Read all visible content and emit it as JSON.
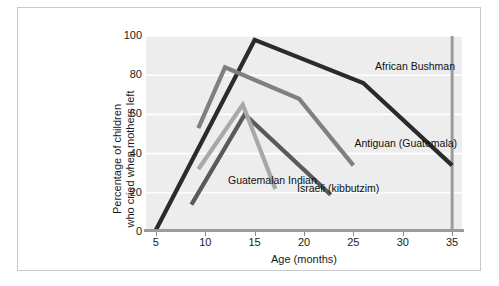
{
  "chart_data": {
    "type": "line",
    "title": "",
    "subtitle": "",
    "xlabel": "Age (months)",
    "ylabel": "Percentage of children who cried when mothers left",
    "ylabel_line1": "Percentage of children",
    "ylabel_line2": "who cried when mothers left",
    "xlim": [
      4,
      36
    ],
    "ylim": [
      0,
      100
    ],
    "xticks": [
      5,
      10,
      15,
      20,
      25,
      30,
      35
    ],
    "yticks": [
      0,
      20,
      40,
      60,
      80,
      100
    ],
    "xtick_labels": [
      "5",
      "10",
      "15",
      "20",
      "25",
      "30",
      "35"
    ],
    "ytick_labels": [
      "0",
      "20",
      "40",
      "60",
      "80",
      "100"
    ],
    "grid": "horizontal-white-gridlines",
    "legend": "inline-annotations",
    "panel_background": "#ededed",
    "gridline_color": "#ffffff",
    "series": [
      {
        "name": "African Bushman",
        "color": "#2b2b2b",
        "x": [
          5,
          15,
          26,
          35
        ],
        "y": [
          1,
          98,
          76,
          34
        ],
        "label_x": 27.2,
        "label_y": 84
      },
      {
        "name": "Antiguan (Guatemala)",
        "color": "#808080",
        "x": [
          9.3,
          12,
          19.5,
          25
        ],
        "y": [
          53,
          84,
          68,
          34
        ],
        "label_x": 25.1,
        "label_y": 45
      },
      {
        "name": "Israeli (kibbutzim)",
        "color": "#5a5a5a",
        "x": [
          8.6,
          14,
          22.7
        ],
        "y": [
          14,
          60,
          19
        ],
        "label_x": 19.3,
        "label_y": 22
      },
      {
        "name": "Guatemalan Indian",
        "color": "#a8a8a8",
        "x": [
          9.3,
          13.8,
          17.1
        ],
        "y": [
          32,
          65,
          22
        ],
        "label_x": 12.3,
        "label_y": 26
      }
    ],
    "annotations": [
      {
        "text": "African Bushman",
        "series": "African Bushman"
      },
      {
        "text": "Antiguan (Guatemala)",
        "series": "Antiguan (Guatemala)"
      },
      {
        "text": "Israeli (kibbutzim)",
        "series": "Israeli (kibbutzim)"
      },
      {
        "text": "Guatemalan Indian",
        "series": "Guatemalan Indian"
      }
    ]
  }
}
